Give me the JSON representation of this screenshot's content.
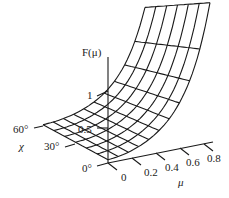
{
  "chart_data": {
    "type": "surface",
    "title": "",
    "zlabel": "F(μ)",
    "xlabel": "μ",
    "ylabel": "χ",
    "x_ticks": [
      "0",
      "0.2",
      "0.4",
      "0.6",
      "0.8"
    ],
    "y_ticks": [
      "0°",
      "30°",
      "60°"
    ],
    "z_ticks": [
      "0.5",
      "1"
    ],
    "x_range": [
      0,
      0.85
    ],
    "y_range": [
      0,
      60
    ],
    "grid": "wireframe",
    "mu_grid": [
      0,
      0.085,
      0.17,
      0.255,
      0.34,
      0.425,
      0.51,
      0.595,
      0.68,
      0.765,
      0.85
    ],
    "chi_grid": [
      0,
      10,
      20,
      30,
      40,
      50,
      60
    ],
    "F_at_mu_max": {
      "chi_0": 1.95,
      "chi_60": 1.42
    },
    "F_at_mu_0": 0.0,
    "color": "#1a1a1a"
  },
  "labels": {
    "z_axis": "F(μ)",
    "z_one": "1",
    "z_half": "0.5",
    "chi_60": "60°",
    "chi_30": "30°",
    "chi_0": "0°",
    "chi_name": "χ",
    "mu_0": "0",
    "mu_02": "0.2",
    "mu_04": "0.4",
    "mu_06": "0.6",
    "mu_08": "0.8",
    "mu_name": "μ"
  }
}
